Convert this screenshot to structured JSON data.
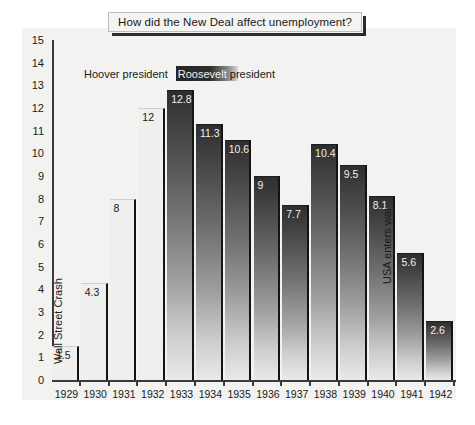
{
  "title": {
    "text": "How did the New Deal affect unemployment?"
  },
  "legend": {
    "hoover": "Hoover president",
    "roosevelt_highlight": "Roosevelt",
    "roosevelt_rest": " president"
  },
  "annotations": [
    {
      "name": "wall-street-crash",
      "text": "Wall Street Crash",
      "year": "1929"
    },
    {
      "name": "usa-enters-war",
      "text": "USA enters war",
      "year": "1941"
    }
  ],
  "chart_data": {
    "type": "bar",
    "title": "How did the New Deal affect unemployment?",
    "xlabel": "",
    "ylabel": "Millions unemployed",
    "ylim": [
      0,
      15
    ],
    "yticks": [
      "0",
      "1",
      "2",
      "3",
      "4",
      "5",
      "6",
      "7",
      "8",
      "9",
      "10",
      "11",
      "12",
      "13",
      "14",
      "15"
    ],
    "categories": [
      "1929",
      "1930",
      "1931",
      "1932",
      "1933",
      "1934",
      "1935",
      "1936",
      "1937",
      "1938",
      "1939",
      "1940",
      "1941",
      "1942"
    ],
    "values": [
      1.5,
      4.3,
      8,
      12,
      12.8,
      11.3,
      10.6,
      9,
      7.7,
      10.4,
      9.5,
      8.1,
      5.6,
      2.6
    ],
    "value_labels": [
      "1.5",
      "4.3",
      "8",
      "12",
      "12.8",
      "11.3",
      "10.6",
      "9",
      "7.7",
      "10.4",
      "9.5",
      "8.1",
      "5.6",
      "2.6"
    ],
    "series_groups": [
      {
        "name": "Hoover president",
        "years": [
          "1929",
          "1930",
          "1931",
          "1932"
        ],
        "style": "light"
      },
      {
        "name": "Roosevelt president",
        "years": [
          "1933",
          "1934",
          "1935",
          "1936",
          "1937",
          "1938",
          "1939",
          "1940",
          "1941",
          "1942"
        ],
        "style": "dark-gradient"
      }
    ],
    "grid": false,
    "legend_position": "top-left-inside",
    "annotations": [
      {
        "label": "Wall Street Crash",
        "at_category": "1929",
        "rotation": -90
      },
      {
        "label": "USA enters war",
        "at_category": "1941",
        "rotation": -90
      }
    ],
    "colors": {
      "panel_background": "#f2f2f0",
      "axis": "#3a3a3a",
      "bar_light": "#efefed",
      "bar_dark_top": "#2e2e2e",
      "bar_dark_bottom": "#e9e9e7",
      "bar_edge": "#141414",
      "text": "#1a1a1a"
    }
  }
}
